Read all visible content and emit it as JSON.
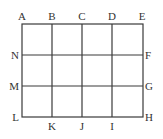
{
  "diagram": {
    "type": "grid",
    "columns": 4,
    "rows": 3,
    "line_color": "#3a3a3a",
    "label_color": "#333333",
    "x_lines": [
      22,
      52,
      82,
      112,
      143
    ],
    "y_lines": [
      24,
      55,
      86,
      117
    ],
    "labels": {
      "top": [
        "A",
        "B",
        "C",
        "D",
        "E"
      ],
      "right": [
        "F",
        "G"
      ],
      "corner_bottom_right": "H",
      "bottom": [
        "I",
        "J",
        "K"
      ],
      "corner_bottom_left": "L",
      "left": [
        "M",
        "N"
      ]
    },
    "points": [
      {
        "name": "A",
        "x": 22,
        "y": 24
      },
      {
        "name": "B",
        "x": 52,
        "y": 24
      },
      {
        "name": "C",
        "x": 82,
        "y": 24
      },
      {
        "name": "D",
        "x": 112,
        "y": 24
      },
      {
        "name": "E",
        "x": 143,
        "y": 24
      },
      {
        "name": "F",
        "x": 143,
        "y": 55
      },
      {
        "name": "G",
        "x": 143,
        "y": 86
      },
      {
        "name": "H",
        "x": 143,
        "y": 117
      },
      {
        "name": "I",
        "x": 112,
        "y": 117
      },
      {
        "name": "J",
        "x": 82,
        "y": 117
      },
      {
        "name": "K",
        "x": 52,
        "y": 117
      },
      {
        "name": "L",
        "x": 22,
        "y": 117
      },
      {
        "name": "M",
        "x": 22,
        "y": 86
      },
      {
        "name": "N",
        "x": 22,
        "y": 55
      }
    ]
  }
}
